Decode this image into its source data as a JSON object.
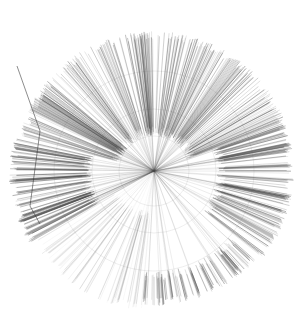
{
  "figure": {
    "type": "radial-dendrogram",
    "background": "#ffffff",
    "line_color": "#4a4a4a",
    "center": [
      154,
      171
    ],
    "outer_radius": 140,
    "inner_arc_radii": [
      35,
      62,
      100
    ],
    "branch_count": 620,
    "seed": 7,
    "sectors": [
      {
        "start_deg": -165,
        "end_deg": -20,
        "r_inner": 35,
        "r_outer": 140,
        "density": 1.0,
        "opacity": 0.55
      },
      {
        "start_deg": -20,
        "end_deg": 40,
        "r_inner": 62,
        "r_outer": 140,
        "density": 1.1,
        "opacity": 0.6
      },
      {
        "start_deg": 40,
        "end_deg": 95,
        "r_inner": 100,
        "r_outer": 135,
        "density": 1.0,
        "opacity": 0.55
      },
      {
        "start_deg": 95,
        "end_deg": 150,
        "r_inner": 40,
        "r_outer": 140,
        "density": 0.6,
        "opacity": 0.18
      },
      {
        "start_deg": 150,
        "end_deg": 195,
        "r_inner": 62,
        "r_outer": 145,
        "density": 1.2,
        "opacity": 0.7
      }
    ],
    "text_labels": []
  }
}
